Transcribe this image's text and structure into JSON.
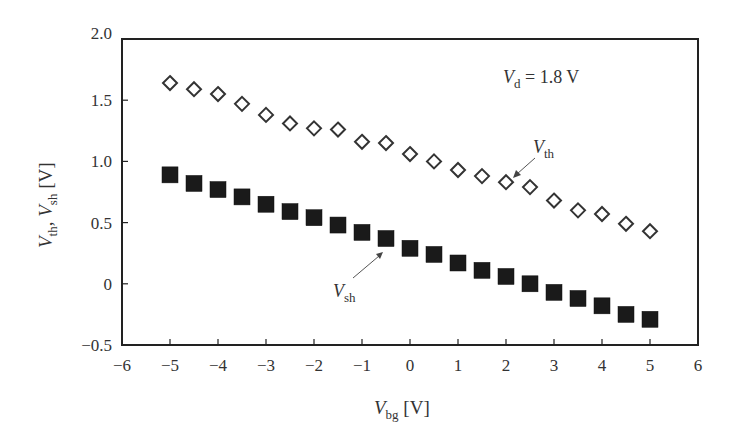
{
  "chart_data": {
    "type": "scatter",
    "title": "",
    "xlabel": "V_bg [V]",
    "ylabel": "V_th, V_sh [V]",
    "xlim": [
      -6,
      6
    ],
    "ylim": [
      -0.5,
      2.0
    ],
    "grid": false,
    "x_ticks": [
      -6,
      -5,
      -4,
      -3,
      -2,
      -1,
      0,
      1,
      2,
      3,
      4,
      5,
      6
    ],
    "x_tick_labels": [
      "−6",
      "−5",
      "−4",
      "−3",
      "−2",
      "−1",
      "0",
      "1",
      "2",
      "3",
      "4",
      "5",
      "6"
    ],
    "y_ticks": [
      -0.5,
      0,
      0.5,
      1.0,
      1.5,
      2.0
    ],
    "y_tick_labels": [
      "−0.5",
      "0",
      "0.5",
      "1.0",
      "1.5",
      "2.0"
    ],
    "x": [
      -5,
      -4.5,
      -4,
      -3.5,
      -3,
      -2.5,
      -2,
      -1.5,
      -1,
      -0.5,
      0,
      0.5,
      1,
      1.5,
      2,
      2.5,
      3,
      3.5,
      4,
      4.5,
      5
    ],
    "series": [
      {
        "name": "V_th",
        "marker": "open-diamond",
        "values": [
          1.64,
          1.59,
          1.55,
          1.47,
          1.38,
          1.31,
          1.27,
          1.26,
          1.16,
          1.15,
          1.06,
          1.0,
          0.93,
          0.88,
          0.83,
          0.79,
          0.68,
          0.6,
          0.57,
          0.49,
          0.43
        ]
      },
      {
        "name": "V_sh",
        "marker": "filled-square",
        "values": [
          0.89,
          0.82,
          0.77,
          0.71,
          0.65,
          0.59,
          0.54,
          0.48,
          0.42,
          0.37,
          0.29,
          0.24,
          0.17,
          0.11,
          0.06,
          0.0,
          -0.07,
          -0.12,
          -0.18,
          -0.25,
          -0.29
        ]
      }
    ],
    "annotations": [
      {
        "text": "V_d = 1.8 V",
        "main": "V",
        "sub": "d",
        "rest": " = 1.8 V"
      },
      {
        "text": "V_th",
        "main": "V",
        "sub": "th",
        "points_to_x": 2
      },
      {
        "text": "V_sh",
        "main": "V",
        "sub": "sh",
        "points_to_x": -0.5
      }
    ],
    "legend": "none (inline arrow annotations)"
  },
  "labels": {
    "x_main": "V",
    "x_sub": "bg",
    "x_unit": " [V]",
    "y_main1": "V",
    "y_sub1": "th",
    "y_sep": ", ",
    "y_main2": "V",
    "y_sub2": "sh",
    "y_unit": " [V]",
    "vd_main": "V",
    "vd_sub": "d",
    "vd_rest": " = 1.8 V",
    "vth_main": "V",
    "vth_sub": "th",
    "vsh_main": "V",
    "vsh_sub": "sh"
  },
  "colors": {
    "ink": "#333333",
    "marker_fill": "#1a1a1a",
    "background": "#ffffff"
  }
}
